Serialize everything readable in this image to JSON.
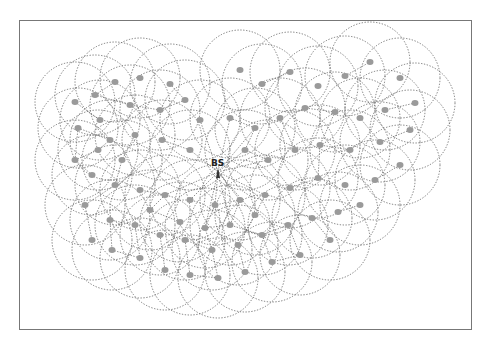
{
  "diagram": {
    "type": "wireless-sensor-network-topology",
    "base_station": {
      "label": "BS",
      "x": 218,
      "y": 172
    },
    "range_radius": 40,
    "colors": {
      "frame": "#777777",
      "range_circle": "#6a6a6a",
      "node": "#9a9a9a",
      "link": "#5a5a5a"
    },
    "nodes": [
      [
        75,
        102
      ],
      [
        95,
        95
      ],
      [
        115,
        82
      ],
      [
        140,
        78
      ],
      [
        170,
        84
      ],
      [
        185,
        100
      ],
      [
        200,
        120
      ],
      [
        160,
        110
      ],
      [
        130,
        105
      ],
      [
        100,
        120
      ],
      [
        78,
        128
      ],
      [
        110,
        140
      ],
      [
        135,
        135
      ],
      [
        162,
        140
      ],
      [
        190,
        150
      ],
      [
        240,
        70
      ],
      [
        262,
        84
      ],
      [
        290,
        72
      ],
      [
        318,
        86
      ],
      [
        345,
        76
      ],
      [
        370,
        62
      ],
      [
        400,
        78
      ],
      [
        415,
        103
      ],
      [
        385,
        110
      ],
      [
        360,
        118
      ],
      [
        335,
        112
      ],
      [
        305,
        108
      ],
      [
        280,
        118
      ],
      [
        255,
        128
      ],
      [
        230,
        118
      ],
      [
        380,
        142
      ],
      [
        350,
        150
      ],
      [
        320,
        145
      ],
      [
        295,
        150
      ],
      [
        268,
        160
      ],
      [
        245,
        150
      ],
      [
        410,
        130
      ],
      [
        400,
        165
      ],
      [
        375,
        180
      ],
      [
        345,
        185
      ],
      [
        318,
        178
      ],
      [
        290,
        188
      ],
      [
        265,
        195
      ],
      [
        240,
        200
      ],
      [
        215,
        205
      ],
      [
        190,
        200
      ],
      [
        165,
        195
      ],
      [
        140,
        190
      ],
      [
        115,
        185
      ],
      [
        92,
        175
      ],
      [
        75,
        160
      ],
      [
        85,
        205
      ],
      [
        110,
        220
      ],
      [
        135,
        225
      ],
      [
        160,
        235
      ],
      [
        185,
        240
      ],
      [
        212,
        250
      ],
      [
        238,
        245
      ],
      [
        262,
        235
      ],
      [
        288,
        225
      ],
      [
        312,
        218
      ],
      [
        338,
        212
      ],
      [
        360,
        205
      ],
      [
        330,
        240
      ],
      [
        300,
        255
      ],
      [
        272,
        262
      ],
      [
        245,
        272
      ],
      [
        218,
        278
      ],
      [
        190,
        275
      ],
      [
        165,
        270
      ],
      [
        140,
        258
      ],
      [
        112,
        250
      ],
      [
        92,
        240
      ],
      [
        205,
        228
      ],
      [
        230,
        225
      ],
      [
        255,
        215
      ],
      [
        180,
        222
      ],
      [
        150,
        210
      ],
      [
        122,
        160
      ],
      [
        98,
        150
      ]
    ]
  }
}
